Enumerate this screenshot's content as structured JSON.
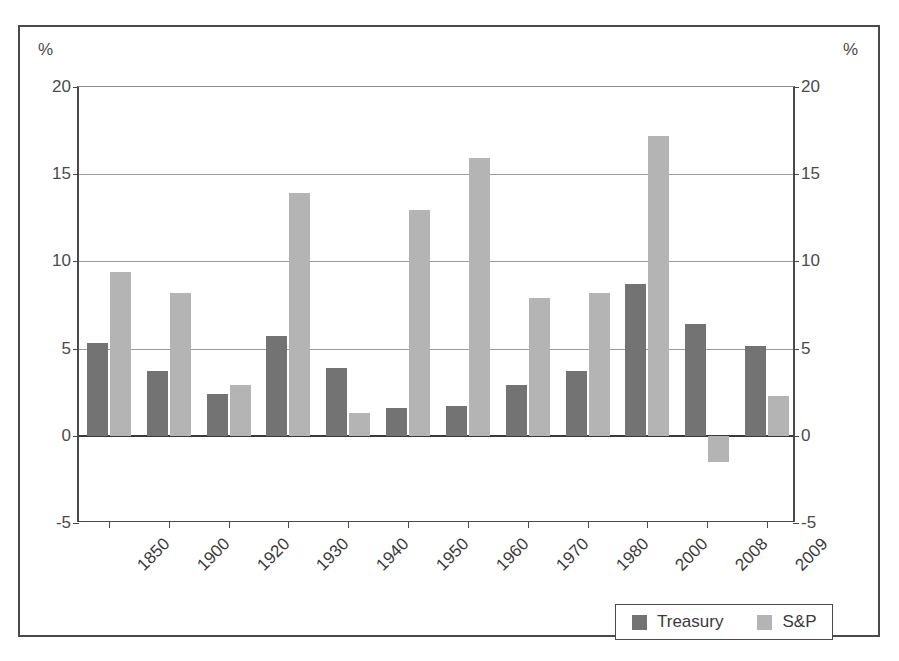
{
  "chart_data": {
    "type": "bar",
    "title": "",
    "subtitle": "",
    "xlabel": "",
    "ylabel": "%",
    "ylabel_right": "%",
    "ylim": [
      -5,
      20
    ],
    "yticks": [
      20,
      15,
      10,
      5,
      0,
      -5
    ],
    "ytick_labels": [
      "20",
      "15",
      "10",
      "5",
      "0",
      "-5"
    ],
    "grid": true,
    "legend_position": "bottom-right",
    "categories": [
      "1850",
      "1900",
      "1920",
      "1930",
      "1940",
      "1950",
      "1960",
      "1970",
      "1980",
      "2000",
      "2008",
      "2009"
    ],
    "series": [
      {
        "name": "Treasury",
        "color": "#737373",
        "values": [
          5.3,
          3.7,
          2.4,
          5.7,
          3.9,
          1.6,
          1.7,
          2.9,
          3.7,
          8.7,
          6.4,
          5.15
        ]
      },
      {
        "name": "S&P",
        "color": "#b4b4b4",
        "values": [
          9.4,
          8.2,
          2.9,
          13.9,
          1.3,
          12.95,
          15.95,
          7.9,
          8.2,
          17.2,
          -1.5,
          2.3
        ]
      }
    ]
  },
  "legend": {
    "items": [
      {
        "label": "Treasury",
        "swatch": "treasury"
      },
      {
        "label": "S&P",
        "swatch": "sp"
      }
    ]
  },
  "axes": {
    "unit_left": "%",
    "unit_right": "%"
  }
}
